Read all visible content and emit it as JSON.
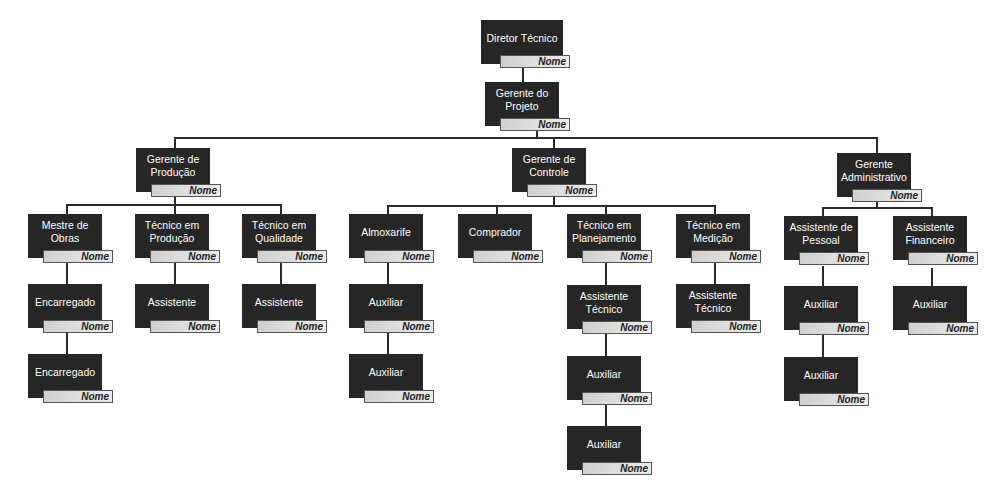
{
  "placeholder_name": "Nome",
  "colors": {
    "box": "#262626",
    "box_text": "#ffffff",
    "name_bar": "#dcdcdc",
    "connector": "#2a2a2a"
  },
  "nodes": {
    "diretor": {
      "title": "Diretor Técnico",
      "name": "Nome"
    },
    "gerente_projeto": {
      "title": "Gerente do\nProjeto",
      "name": "Nome"
    },
    "gerente_producao": {
      "title": "Gerente de\nProdução",
      "name": "Nome"
    },
    "gerente_controle": {
      "title": "Gerente de\nControle",
      "name": "Nome"
    },
    "gerente_adm": {
      "title": "Gerente\nAdministrativo",
      "name": "Nome"
    },
    "mestre_obras": {
      "title": "Mestre de\nObras",
      "name": "Nome"
    },
    "encarregado_1": {
      "title": "Encarregado",
      "name": "Nome"
    },
    "encarregado_2": {
      "title": "Encarregado",
      "name": "Nome"
    },
    "tec_producao": {
      "title": "Técnico em\nProdução",
      "name": "Nome"
    },
    "assist_producao": {
      "title": "Assistente",
      "name": "Nome"
    },
    "tec_qualidade": {
      "title": "Técnico em\nQualidade",
      "name": "Nome"
    },
    "assist_qualidade": {
      "title": "Assistente",
      "name": "Nome"
    },
    "almoxarife": {
      "title": "Almoxarife",
      "name": "Nome"
    },
    "aux_almox_1": {
      "title": "Auxiliar",
      "name": "Nome"
    },
    "aux_almox_2": {
      "title": "Auxiliar",
      "name": "Nome"
    },
    "comprador": {
      "title": "Comprador",
      "name": "Nome"
    },
    "tec_planejamento": {
      "title": "Técnico em\nPlanejamento",
      "name": "Nome"
    },
    "assist_tec_plan": {
      "title": "Assistente\nTécnico",
      "name": "Nome"
    },
    "aux_plan_1": {
      "title": "Auxiliar",
      "name": "Nome"
    },
    "aux_plan_2": {
      "title": "Auxiliar",
      "name": "Nome"
    },
    "tec_medicao": {
      "title": "Técnico em\nMedição",
      "name": "Nome"
    },
    "assist_tec_med": {
      "title": "Assistente\nTécnico",
      "name": "Nome"
    },
    "assist_pessoal": {
      "title": "Assistente de\nPessoal",
      "name": "Nome"
    },
    "aux_pessoal_1": {
      "title": "Auxiliar",
      "name": "Nome"
    },
    "aux_pessoal_2": {
      "title": "Auxiliar",
      "name": "Nome"
    },
    "assist_financeiro": {
      "title": "Assistente\nFinanceiro",
      "name": "Nome"
    },
    "aux_financeiro": {
      "title": "Auxiliar",
      "name": "Nome"
    }
  }
}
